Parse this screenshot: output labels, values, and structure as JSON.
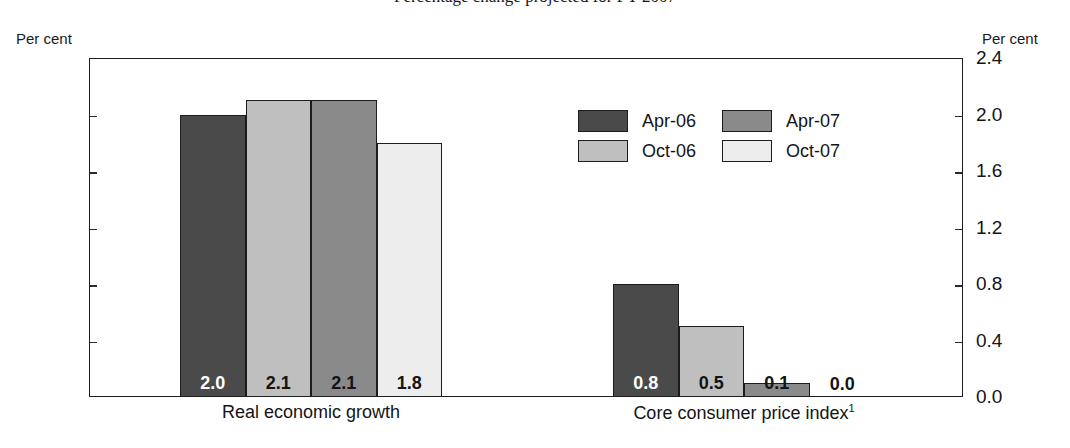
{
  "title": "Percentage change projected for FY 2007",
  "axis": {
    "unit_left": "Per cent",
    "unit_right": "Per cent",
    "ticks": [
      "2.4",
      "2.0",
      "1.6",
      "1.2",
      "0.8",
      "0.4",
      "0.0"
    ]
  },
  "legend": {
    "items": [
      {
        "label": "Apr-06",
        "color": "#4a4a4a"
      },
      {
        "label": "Apr-07",
        "color": "#8a8a8a"
      },
      {
        "label": "Oct-06",
        "color": "#bfbfbf"
      },
      {
        "label": "Oct-07",
        "color": "#ededed"
      }
    ]
  },
  "chart_data": {
    "type": "bar",
    "title": "Percentage change projected for FY 2007",
    "xlabel": "",
    "ylabel": "Per cent",
    "ylim": [
      0.0,
      2.4
    ],
    "ytick_step": 0.4,
    "grid": false,
    "legend_position": "inside-upper-right",
    "categories": [
      "Real economic growth",
      "Core consumer price index"
    ],
    "category_labels": [
      "Real economic growth",
      "Core consumer price index¹"
    ],
    "footnote_marker": "1",
    "series": [
      {
        "name": "Apr-06",
        "color": "#4a4a4a",
        "values": [
          2.0,
          0.8
        ],
        "labels": [
          "2.0",
          "0.8"
        ]
      },
      {
        "name": "Oct-06",
        "color": "#bfbfbf",
        "values": [
          2.1,
          0.5
        ],
        "labels": [
          "2.1",
          "0.5"
        ]
      },
      {
        "name": "Apr-07",
        "color": "#8a8a8a",
        "values": [
          2.1,
          0.1
        ],
        "labels": [
          "2.1",
          "0.1"
        ]
      },
      {
        "name": "Oct-07",
        "color": "#ededed",
        "values": [
          1.8,
          0.0
        ],
        "labels": [
          "1.8",
          "0.0"
        ]
      }
    ]
  }
}
